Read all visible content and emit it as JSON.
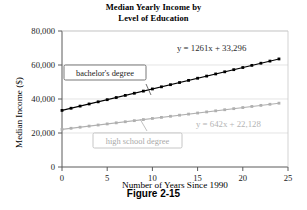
{
  "figure": {
    "caption": "Figure 2-15"
  },
  "chart_data": {
    "type": "scatter",
    "title": "Median Yearly Income by Level of Education",
    "title_line1": "Median Yearly Income by",
    "title_line2": "Level of Education",
    "xlabel": "Number of Years Since 1990",
    "ylabel": "Median Income ($)",
    "xlim": [
      0,
      25
    ],
    "ylim": [
      0,
      80000
    ],
    "xticks": [
      0,
      5,
      10,
      15,
      20,
      25
    ],
    "xtick_labels": [
      "0",
      "5",
      "10",
      "15",
      "20",
      "25"
    ],
    "yticks": [
      0,
      20000,
      40000,
      60000,
      80000
    ],
    "ytick_labels": [
      "0",
      "20,000",
      "40,000",
      "60,000",
      "80,000"
    ],
    "grid": true,
    "grid_axis": "y",
    "legend_position": "inline-callout",
    "series": [
      {
        "name": "bachelor's degree",
        "label": "bachelor's degree",
        "color": "#000000",
        "equation": "y = 1261x + 33,296",
        "slope": 1261,
        "intercept": 33296,
        "marker": "square",
        "x": [
          0,
          1,
          2,
          3,
          4,
          5,
          6,
          7,
          8,
          9,
          10,
          11,
          12,
          13,
          14,
          15,
          16,
          17,
          18,
          19,
          20,
          21,
          22,
          23,
          24
        ],
        "values": [
          33296,
          34557,
          35818,
          37079,
          38340,
          39601,
          40862,
          42123,
          43384,
          44645,
          45906,
          47167,
          48428,
          49689,
          50950,
          52211,
          53472,
          54733,
          55994,
          57255,
          58516,
          59777,
          61038,
          62299,
          63560
        ],
        "callout": {
          "text": "bachelor's degree",
          "anchor_x": 9.2,
          "anchor_y": 46000
        },
        "equation_position": {
          "x": 13.5,
          "y": 70000
        }
      },
      {
        "name": "high school degree",
        "label": "high school degree",
        "color": "#b0b0b0",
        "equation": "y = 642x + 22,128",
        "slope": 642,
        "intercept": 22128,
        "marker": "square",
        "x": [
          0,
          1,
          2,
          3,
          4,
          5,
          6,
          7,
          8,
          9,
          10,
          11,
          12,
          13,
          14,
          15,
          16,
          17,
          18,
          19,
          20,
          21,
          22,
          23,
          24
        ],
        "values": [
          22128,
          22770,
          23412,
          24054,
          24696,
          25338,
          25980,
          26622,
          27264,
          27906,
          28548,
          29190,
          29832,
          30474,
          31116,
          31758,
          32400,
          33042,
          33684,
          34326,
          34968,
          35610,
          36252,
          36894,
          37536
        ],
        "callout": {
          "text": "high school degree",
          "anchor_x": 9.4,
          "anchor_y": 28400
        },
        "equation_position": {
          "x": 16.0,
          "y": 19500
        }
      }
    ]
  }
}
